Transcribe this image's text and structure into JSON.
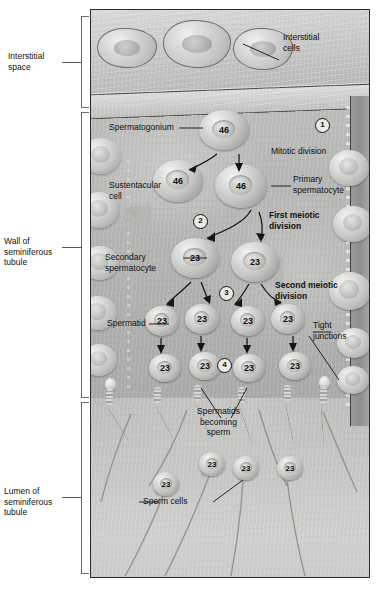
{
  "figure": {
    "style": "grayscale medical illustration"
  },
  "left_brackets": [
    {
      "id": "interstitial-space",
      "label": "Interstitial\nspace"
    },
    {
      "id": "wall-of-seminiferous-tubule",
      "label": "Wall of\nseminiferous\ntubule"
    },
    {
      "id": "lumen-of-seminiferous-tubule",
      "label": "Lumen of\nseminiferous\ntubule"
    }
  ],
  "callouts": {
    "interstitial_cells": "Interstitial\ncells",
    "spermatogonium": "Spermatogonium",
    "mitotic_division": "Mitotic division",
    "primary_spermatocyte": "Primary\nspermatocyte",
    "sustentacular_cell": "Sustentacular\ncell",
    "first_meiotic_division": "First meiotic\ndivision",
    "secondary_spermatocyte": "Secondary\nspermatocyte",
    "second_meiotic_division": "Second meiotic\ndivision",
    "spermatid": "Spermatid",
    "tight_junctions": "Tight\njunctions",
    "spermatids_becoming_sperm": "Spermatids\nbecoming\nsperm",
    "sperm_cells": "Sperm cells"
  },
  "steps": [
    {
      "n": "1"
    },
    {
      "n": "2"
    },
    {
      "n": "3"
    },
    {
      "n": "4"
    }
  ],
  "chromosome_counts": {
    "spermatogonium": "46",
    "spermatogonium_daughter": "46",
    "primary_spermatocyte": "46",
    "secondary_spermatocyte": "23",
    "spermatid": "23",
    "sperm": "23"
  },
  "cells": {
    "diploid_46": [
      "46",
      "46",
      "46"
    ],
    "secondary_spermatocytes_23": [
      "23",
      "23"
    ],
    "spermatids_row1_23": [
      "23",
      "23",
      "23",
      "23"
    ],
    "spermatids_row2_23": [
      "23",
      "23",
      "23",
      "23"
    ],
    "sperm_23": [
      "23",
      "23",
      "23",
      "23"
    ]
  },
  "colors": {
    "panel_border": "#2b2b2b",
    "tissue_light": "#d8d8d6",
    "tissue_mid": "#bcbcba",
    "tissue_dark": "#a9a9a7",
    "text": "#111111"
  }
}
